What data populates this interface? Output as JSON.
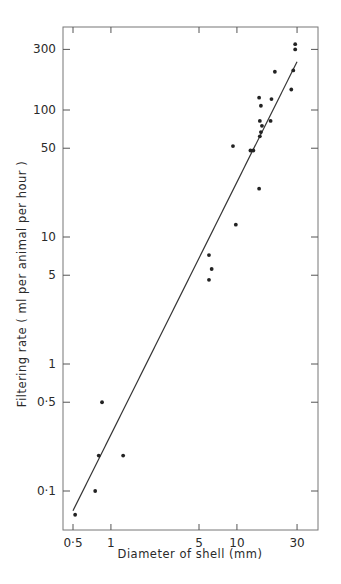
{
  "chart_data": {
    "type": "scatter",
    "title": "",
    "xlabel": "Diameter of shell (mm)",
    "ylabel": "Filtering rate ( ml per animal per hour )",
    "x_scale": "log",
    "y_scale": "log",
    "xlim": [
      0.42,
      40
    ],
    "ylim": [
      0.06,
      400
    ],
    "x_ticks": [
      {
        "value": 0.5,
        "label": "0·5"
      },
      {
        "value": 1,
        "label": "1"
      },
      {
        "value": 5,
        "label": "5"
      },
      {
        "value": 10,
        "label": "10"
      },
      {
        "value": 30,
        "label": "30"
      }
    ],
    "y_ticks": [
      {
        "value": 0.1,
        "label": "0·1"
      },
      {
        "value": 0.5,
        "label": "0·5"
      },
      {
        "value": 1,
        "label": "1"
      },
      {
        "value": 5,
        "label": "5"
      },
      {
        "value": 10,
        "label": "10"
      },
      {
        "value": 50,
        "label": "50"
      },
      {
        "value": 100,
        "label": "100"
      },
      {
        "value": 300,
        "label": "300"
      }
    ],
    "grid": false,
    "legend": null,
    "series": [
      {
        "name": "observations",
        "points": [
          {
            "x": 0.52,
            "y": 0.065
          },
          {
            "x": 0.75,
            "y": 0.1
          },
          {
            "x": 0.8,
            "y": 0.19
          },
          {
            "x": 0.85,
            "y": 0.5
          },
          {
            "x": 1.25,
            "y": 0.19
          },
          {
            "x": 6.0,
            "y": 4.6
          },
          {
            "x": 6.3,
            "y": 5.6
          },
          {
            "x": 6.0,
            "y": 7.2
          },
          {
            "x": 9.8,
            "y": 12.5
          },
          {
            "x": 9.3,
            "y": 52
          },
          {
            "x": 12.8,
            "y": 48
          },
          {
            "x": 13.5,
            "y": 48
          },
          {
            "x": 15.0,
            "y": 24
          },
          {
            "x": 15.2,
            "y": 62
          },
          {
            "x": 15.5,
            "y": 67
          },
          {
            "x": 15.2,
            "y": 82
          },
          {
            "x": 15.8,
            "y": 75
          },
          {
            "x": 15.5,
            "y": 108
          },
          {
            "x": 15.0,
            "y": 125
          },
          {
            "x": 18.5,
            "y": 82
          },
          {
            "x": 18.8,
            "y": 122
          },
          {
            "x": 20.0,
            "y": 200
          },
          {
            "x": 27.0,
            "y": 145
          },
          {
            "x": 28.0,
            "y": 205
          },
          {
            "x": 29.0,
            "y": 300
          },
          {
            "x": 29.0,
            "y": 330
          }
        ]
      },
      {
        "name": "fitted line",
        "type": "line",
        "points": [
          {
            "x": 0.5,
            "y": 0.07
          },
          {
            "x": 30,
            "y": 240
          }
        ]
      }
    ]
  }
}
